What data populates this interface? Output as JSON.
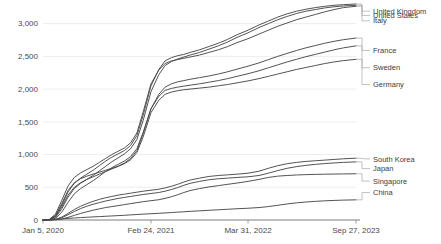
{
  "chart_data": {
    "type": "line",
    "title": "",
    "subtitle": "",
    "xlabel": "",
    "ylabel": "",
    "grid": true,
    "legend_position": "right-inline-labels",
    "ylim": [
      0,
      3300
    ],
    "yticks": [
      0,
      500,
      1000,
      1500,
      2000,
      2500,
      3000
    ],
    "ytick_labels": [
      "0",
      "500",
      "1,000",
      "1,500",
      "2,000",
      "2,500",
      "3,000"
    ],
    "xticks": [
      "Jan 5, 2020",
      "Feb 24, 2021",
      "Mar 31, 2022",
      "Sep 27, 2023"
    ],
    "xtick_positions": [
      0,
      0.345,
      0.655,
      1.0
    ],
    "x": [
      0,
      0.02,
      0.04,
      0.06,
      0.08,
      0.1,
      0.12,
      0.14,
      0.16,
      0.18,
      0.2,
      0.22,
      0.24,
      0.26,
      0.28,
      0.3,
      0.32,
      0.345,
      0.37,
      0.39,
      0.41,
      0.43,
      0.45,
      0.47,
      0.5,
      0.53,
      0.56,
      0.59,
      0.62,
      0.655,
      0.69,
      0.72,
      0.75,
      0.78,
      0.81,
      0.84,
      0.87,
      0.9,
      0.93,
      0.96,
      1.0
    ],
    "series": [
      {
        "name": "United Kingdom",
        "color": "#4a4a4a",
        "label_y_frac": 0.033,
        "values": [
          0,
          5,
          60,
          230,
          430,
          560,
          640,
          700,
          760,
          830,
          900,
          960,
          1010,
          1060,
          1140,
          1290,
          1600,
          2050,
          2300,
          2430,
          2480,
          2510,
          2530,
          2560,
          2600,
          2650,
          2700,
          2760,
          2830,
          2900,
          2980,
          3040,
          3100,
          3150,
          3190,
          3220,
          3245,
          3265,
          3280,
          3290,
          3300
        ]
      },
      {
        "name": "United States",
        "color": "#4a4a4a",
        "label_y_frac": 0.053,
        "values": [
          0,
          3,
          40,
          170,
          350,
          480,
          560,
          620,
          680,
          750,
          820,
          890,
          950,
          1010,
          1090,
          1230,
          1520,
          1960,
          2220,
          2360,
          2420,
          2460,
          2490,
          2520,
          2560,
          2610,
          2660,
          2720,
          2790,
          2860,
          2940,
          3000,
          3060,
          3110,
          3155,
          3190,
          3215,
          3240,
          3258,
          3270,
          3280
        ]
      },
      {
        "name": "Italy",
        "color": "#4a4a4a",
        "label_y_frac": 0.078,
        "values": [
          0,
          8,
          90,
          300,
          520,
          650,
          720,
          770,
          820,
          880,
          940,
          1000,
          1050,
          1100,
          1180,
          1330,
          1650,
          2080,
          2290,
          2390,
          2430,
          2450,
          2470,
          2490,
          2520,
          2560,
          2600,
          2650,
          2710,
          2770,
          2840,
          2900,
          2960,
          3010,
          3060,
          3100,
          3140,
          3180,
          3215,
          3245,
          3265
        ]
      },
      {
        "name": "France",
        "color": "#4a4a4a",
        "label_y_frac": 0.215,
        "values": [
          0,
          4,
          50,
          200,
          380,
          500,
          570,
          620,
          660,
          700,
          740,
          780,
          820,
          870,
          940,
          1060,
          1320,
          1700,
          1920,
          2030,
          2080,
          2110,
          2130,
          2150,
          2175,
          2200,
          2230,
          2265,
          2305,
          2350,
          2400,
          2450,
          2500,
          2545,
          2590,
          2630,
          2665,
          2700,
          2730,
          2755,
          2780
        ]
      },
      {
        "name": "Sweden",
        "color": "#4a4a4a",
        "label_y_frac": 0.295,
        "values": [
          0,
          2,
          25,
          120,
          270,
          400,
          480,
          540,
          600,
          670,
          740,
          800,
          850,
          900,
          970,
          1090,
          1340,
          1700,
          1890,
          1980,
          2010,
          2030,
          2045,
          2060,
          2080,
          2105,
          2130,
          2160,
          2195,
          2235,
          2280,
          2325,
          2370,
          2415,
          2455,
          2495,
          2530,
          2565,
          2600,
          2630,
          2660
        ]
      },
      {
        "name": "Germany",
        "color": "#4a4a4a",
        "label_y_frac": 0.373,
        "values": [
          0,
          6,
          70,
          250,
          450,
          570,
          630,
          670,
          700,
          730,
          760,
          790,
          820,
          860,
          920,
          1030,
          1270,
          1640,
          1830,
          1920,
          1955,
          1975,
          1990,
          2000,
          2015,
          2030,
          2050,
          2070,
          2095,
          2125,
          2160,
          2195,
          2230,
          2265,
          2300,
          2330,
          2360,
          2390,
          2415,
          2435,
          2455
        ]
      },
      {
        "name": "South Korea",
        "color": "#4a4a4a",
        "label_y_frac": 0.718,
        "values": [
          0,
          1,
          10,
          45,
          100,
          160,
          210,
          250,
          285,
          315,
          340,
          360,
          380,
          395,
          410,
          425,
          440,
          455,
          470,
          490,
          515,
          545,
          580,
          610,
          640,
          665,
          680,
          690,
          700,
          715,
          745,
          790,
          830,
          860,
          880,
          895,
          905,
          915,
          925,
          935,
          945
        ]
      },
      {
        "name": "Japan",
        "color": "#4a4a4a",
        "label_y_frac": 0.762,
        "values": [
          0,
          1,
          8,
          35,
          80,
          130,
          175,
          210,
          240,
          265,
          290,
          310,
          330,
          345,
          360,
          375,
          390,
          405,
          420,
          440,
          465,
          495,
          530,
          560,
          590,
          615,
          630,
          640,
          650,
          660,
          680,
          715,
          755,
          790,
          815,
          835,
          850,
          862,
          872,
          880,
          888
        ]
      },
      {
        "name": "Singapore",
        "color": "#4a4a4a",
        "label_y_frac": 0.82,
        "values": [
          0,
          0,
          3,
          15,
          40,
          70,
          100,
          125,
          150,
          170,
          190,
          205,
          220,
          235,
          250,
          265,
          280,
          295,
          310,
          330,
          355,
          385,
          420,
          450,
          480,
          505,
          525,
          545,
          565,
          590,
          620,
          650,
          670,
          680,
          688,
          693,
          697,
          700,
          702,
          704,
          706
        ]
      },
      {
        "name": "China",
        "color": "#4a4a4a",
        "label_y_frac": 0.873,
        "values": [
          0,
          2,
          8,
          16,
          24,
          31,
          37,
          42,
          47,
          52,
          57,
          62,
          67,
          72,
          78,
          84,
          90,
          96,
          102,
          108,
          114,
          120,
          126,
          132,
          140,
          148,
          156,
          164,
          172,
          180,
          190,
          205,
          225,
          245,
          262,
          275,
          285,
          293,
          299,
          304,
          308
        ]
      }
    ]
  }
}
